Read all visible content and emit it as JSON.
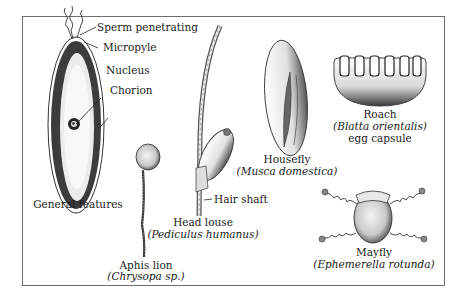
{
  "figure": {
    "general_features": {
      "caption": "General features",
      "callouts": [
        "Sperm penetrating",
        "Micropyle",
        "Nucleus",
        "Chorion"
      ]
    },
    "specimens": [
      {
        "common": "Aphis lion",
        "scientific": "(Chrysopa sp.)"
      },
      {
        "common": "Head louse",
        "scientific": "(Pediculus humanus)",
        "callout": "Hair shaft"
      },
      {
        "common": "Housefly",
        "scientific": "(Musca domestica)"
      },
      {
        "common": "Roach",
        "scientific": "(Blatta orientalis)",
        "extra": "egg capsule"
      },
      {
        "common": "Mayfly",
        "scientific": "(Ephemerella rotunda)"
      }
    ],
    "colors": {
      "frame": "#6d6d6d",
      "ink": "#1a1a1a",
      "background": "#ffffff"
    }
  }
}
